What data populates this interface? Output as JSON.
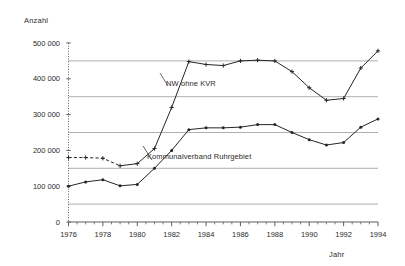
{
  "chart_data": {
    "type": "line",
    "title": "",
    "ylabel": "Anzahl",
    "xlabel": "Jahr",
    "ylim": [
      0,
      500000
    ],
    "xlim": [
      1976,
      1994
    ],
    "grid": true,
    "gridlines_y": [
      50000,
      150000,
      250000,
      350000,
      450000
    ],
    "y_ticks": [
      0,
      100000,
      200000,
      300000,
      400000,
      500000
    ],
    "y_tick_labels": [
      "0",
      "100 000",
      "200 000",
      "300 000",
      "400 000",
      "500 000"
    ],
    "x_ticks": [
      1976,
      1978,
      1980,
      1982,
      1984,
      1986,
      1988,
      1990,
      1992,
      1994
    ],
    "x_tick_labels": [
      "1976",
      "1978",
      "1980",
      "1982",
      "1984",
      "1986",
      "1988",
      "1990",
      "1992",
      "1994"
    ],
    "x_minor_tick_interval": 0.5,
    "legend_position": "inline-annotations",
    "x": [
      1976,
      1977,
      1978,
      1979,
      1980,
      1981,
      1982,
      1983,
      1984,
      1985,
      1986,
      1987,
      1988,
      1989,
      1990,
      1991,
      1992,
      1993,
      1994
    ],
    "series": [
      {
        "name": "NW ohne KVR",
        "marker": "plus",
        "line_style_note": "dashed 1976-1979, solid thereafter",
        "values": [
          180000,
          180000,
          178000,
          157000,
          163000,
          205000,
          320000,
          448000,
          440000,
          437000,
          450000,
          452000,
          450000,
          420000,
          375000,
          340000,
          345000,
          430000,
          478000
        ]
      },
      {
        "name": "Kommunalverband Ruhrgebiet",
        "marker": "dot",
        "line_style_note": "solid",
        "values": [
          100000,
          112000,
          118000,
          101000,
          105000,
          150000,
          200000,
          258000,
          263000,
          263000,
          265000,
          272000,
          272000,
          250000,
          230000,
          215000,
          222000,
          265000,
          288000
        ]
      }
    ]
  },
  "annotations": {
    "nw_label": "NW ohne KVR",
    "kvr_label": "Kommunalverband Ruhrgebiet"
  },
  "style": {
    "line_color": "#262626",
    "grid_color": "#9a9a9a",
    "axis_color": "#4d4d4d",
    "background": "#ffffff"
  }
}
